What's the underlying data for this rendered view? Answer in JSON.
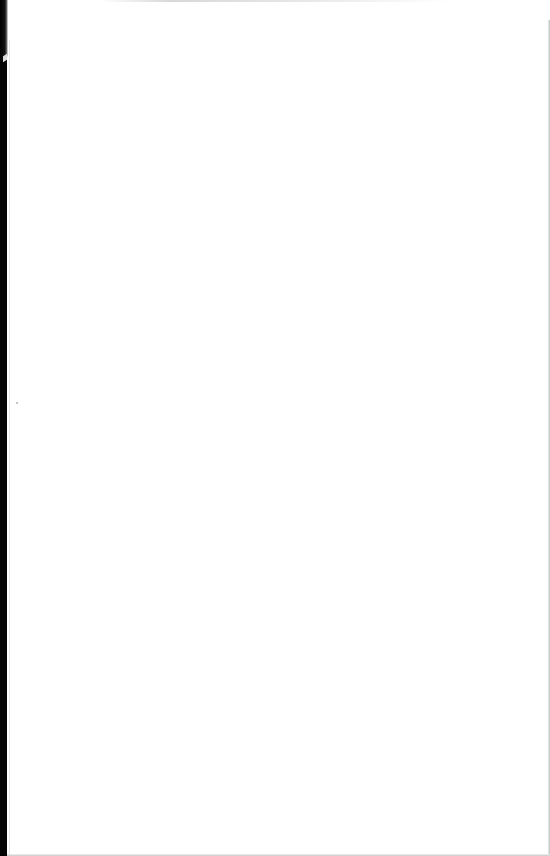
{
  "document": {
    "type": "scanned-page",
    "content": "",
    "colors": {
      "paper": "#ffffff",
      "binding_shadow": "#050505",
      "edge_gray": "#bdbdbd"
    }
  }
}
